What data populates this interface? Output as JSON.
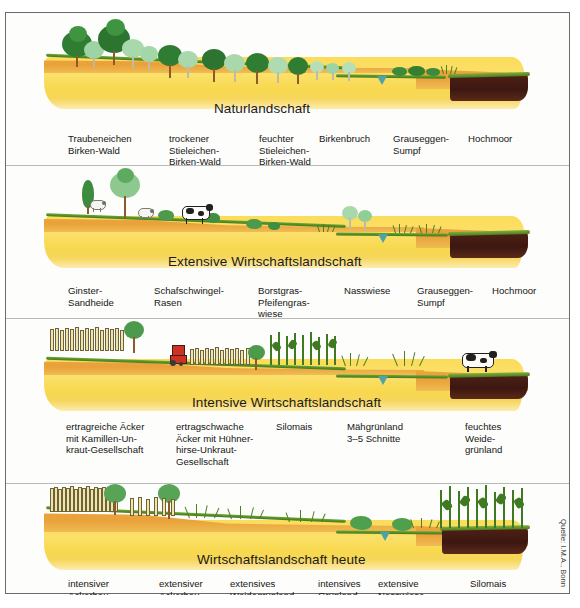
{
  "figure": {
    "credit": "Quelle: I.M.A., Bonn",
    "colors": {
      "subsoil_yellow": "#fbdc5a",
      "topsoil_orange": "#eba33a",
      "peat_brown": "#3c1710",
      "vegetation_green": "#2f7d32",
      "water_teal": "#4fa3a8",
      "frame_gray": "#6b6b6b"
    }
  },
  "panels": [
    {
      "id": "naturlandschaft",
      "title": "Naturlandschaft",
      "labels": [
        {
          "lines": [
            "Traubeneichen",
            "Birken-Wald"
          ]
        },
        {
          "lines": [
            "trockener",
            "Stieleichen-",
            "Birken-Wald"
          ]
        },
        {
          "lines": [
            "feuchter",
            "Stieleichen-",
            "Birken-Wald"
          ]
        },
        {
          "lines": [
            "Birkenbruch"
          ]
        },
        {
          "lines": [
            "Grauseggen-",
            "Sumpf"
          ]
        },
        {
          "lines": [
            "Hochmoor"
          ]
        }
      ]
    },
    {
      "id": "extensive-wirtschaftslandschaft",
      "title": "Extensive Wirtschaftslandschaft",
      "labels": [
        {
          "lines": [
            "Ginster-",
            "Sandheide"
          ]
        },
        {
          "lines": [
            "Schafschwingel-",
            "Rasen"
          ]
        },
        {
          "lines": [
            "Borstgras-",
            "Pfeifengras-",
            "wiese"
          ]
        },
        {
          "lines": [
            "Nasswiese"
          ]
        },
        {
          "lines": [
            "Grauseggen-",
            "Sumpf"
          ]
        },
        {
          "lines": [
            "Hochmoor"
          ]
        }
      ]
    },
    {
      "id": "intensive-wirtschaftslandschaft",
      "title": "Intensive Wirtschaftslandschaft",
      "labels": [
        {
          "lines": [
            "ertragreiche Äcker",
            "mit Kamillen-Un-",
            "kraut-Gesellschaft"
          ]
        },
        {
          "lines": [
            "ertragschwache",
            "Äcker mit Hühner-",
            "hirse-Unkraut-",
            "Gesellschaft"
          ]
        },
        {
          "lines": [
            "Silomais"
          ]
        },
        {
          "lines": [
            "Mähgrünland",
            "3–5 Schnitte"
          ]
        },
        {
          "lines": [
            "feuchtes",
            "Weide-",
            "grünland"
          ]
        }
      ]
    },
    {
      "id": "wirtschaftslandschaft-heute",
      "title": "Wirtschaftslandschaft heute",
      "labels": [
        {
          "lines": [
            "intensiver",
            "Ackerbau"
          ]
        },
        {
          "lines": [
            "extensiver",
            "Ackerbau"
          ]
        },
        {
          "lines": [
            "extensives",
            "Weidegrünland"
          ]
        },
        {
          "lines": [
            "intensives",
            "Grünland"
          ]
        },
        {
          "lines": [
            "extensive",
            "Nasswiese"
          ]
        },
        {
          "lines": [
            "Silomais"
          ]
        }
      ]
    }
  ]
}
